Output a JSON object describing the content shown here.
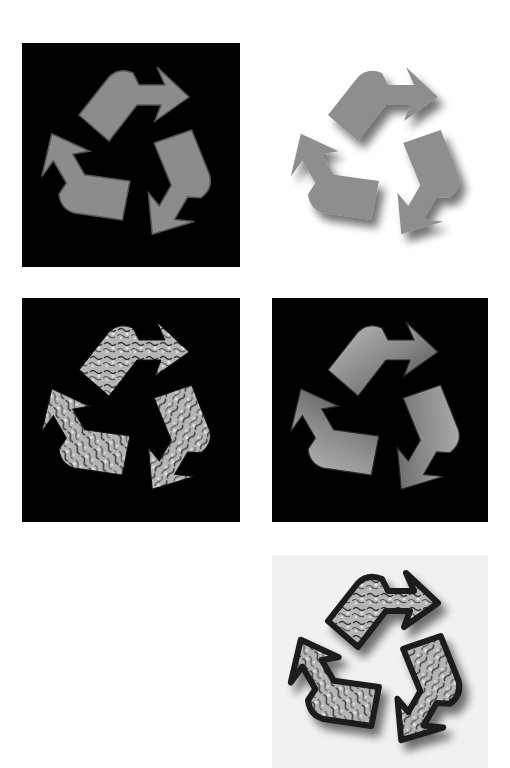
{
  "figure": {
    "panels": [
      {
        "id": "flat-gray-on-black",
        "style": "flat gray arrows with dark outline",
        "background": "#000000",
        "fill": "#8c8c8c"
      },
      {
        "id": "gray-drop-shadow-on-white",
        "style": "gray arrows with soft drop shadow",
        "background": "#ffffff",
        "fill": "#8e8e8e"
      },
      {
        "id": "stone-texture-on-black",
        "style": "marbled stone texture arrows",
        "background": "#000000",
        "fill": "#9a9a9a"
      },
      {
        "id": "beveled-gray-on-black",
        "style": "beveled embossed gray arrows",
        "background": "#000000",
        "fill": "#8a8a8a"
      },
      {
        "id": "framed-texture-on-light",
        "style": "textured arrows with dark frame and shadow",
        "background": "#f1f1f1",
        "fill": "#a5a5a5"
      }
    ]
  }
}
